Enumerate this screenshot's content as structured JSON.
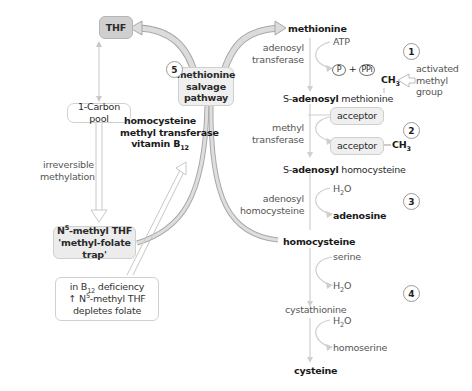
{
  "figure": {
    "colors": {
      "arrow_fill": "#d6d6d6",
      "arrow_stroke": "#a8a8a8",
      "box_fill_dark": "#d0d0d0",
      "box_fill_light": "#f0f0f0",
      "box_border": "#c8c8c8",
      "text": "#2a2a2a"
    }
  },
  "left_panel": {
    "thf": "THF",
    "one_carbon_pool": "1-Carbon pool",
    "irreversible_line1": "irreversible",
    "irreversible_line2": "methylation",
    "n5_line1_pre": "N",
    "n5_line1_sup": "5",
    "n5_line1_post": "-methyl THF",
    "n5_line2": "'methyl-folate trap'",
    "b12_note_line1_pre": "in B",
    "b12_note_line1_sub": "12",
    "b12_note_line1_post": " deficiency",
    "b12_note_line2_pre": "↑ N",
    "b12_note_line2_sup": "5",
    "b12_note_line2_post": "-methyl THF",
    "b12_note_line3": "depletes folate"
  },
  "center": {
    "enzyme_line1": "homocysteine",
    "enzyme_line2": "methyl transferase",
    "enzyme_line3_pre": "vitamin B",
    "enzyme_line3_sub": "12",
    "salvage_number": "5",
    "salvage_line1": "methionine",
    "salvage_line2": "salvage",
    "salvage_line3": "pathway"
  },
  "right_pathway": {
    "methionine": "methionine",
    "step1": {
      "number": "1",
      "enzyme_line1": "adenosyl",
      "enzyme_line2": "transferase",
      "input": "ATP",
      "output_p": "P",
      "plus": "+",
      "output_ppi": "PPi",
      "ch3": "CH",
      "ch3_sub": "3",
      "note_line1": "activated",
      "note_line2": "methyl",
      "note_line3": "group"
    },
    "sam_prefix": "S-",
    "sam_bold": "adenosyl",
    "sam_suffix": " methionine",
    "step2": {
      "number": "2",
      "enzyme_line1": "methyl",
      "enzyme_line2": "transferase",
      "acceptor_in": "acceptor",
      "acceptor_out": "acceptor",
      "ch3": "CH",
      "ch3_sub": "3"
    },
    "sah_prefix": "S-",
    "sah_bold": "adenosyl",
    "sah_suffix": " homocysteine",
    "step3": {
      "number": "3",
      "enzyme_line1": "adenosyl",
      "enzyme_line2": "homocysteine",
      "input_pre": "H",
      "input_sub": "2",
      "input_post": "O",
      "output": "adenosine"
    },
    "homocysteine": "homocysteine",
    "step4": {
      "number": "4",
      "input1": "serine",
      "output1_pre": "H",
      "output1_sub": "2",
      "output1_post": "O",
      "intermediate": "cystathionine",
      "input2_pre": "H",
      "input2_sub": "2",
      "input2_post": "O",
      "output2": "homoserine"
    },
    "cysteine": "cysteine"
  }
}
